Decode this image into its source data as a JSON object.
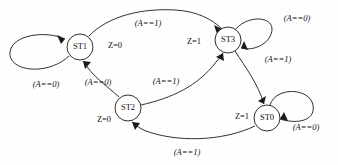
{
  "diagram": {
    "type": "state-transition-diagram",
    "stroke_color": "#1a1a1a",
    "background_color": "#fefefe",
    "states": [
      {
        "id": "ST1",
        "label": "ST1",
        "output_label": "Z=0",
        "output_var": "Z",
        "output_value": "0",
        "cx": 80,
        "cy": 47,
        "r": 13
      },
      {
        "id": "ST3",
        "label": "ST3",
        "output_label": "Z=1",
        "output_var": "Z",
        "output_value": "1",
        "cx": 228,
        "cy": 40,
        "r": 13
      },
      {
        "id": "ST2",
        "label": "ST2",
        "output_label": "Z=0",
        "output_var": "Z",
        "output_value": "0",
        "cx": 128,
        "cy": 108,
        "r": 13
      },
      {
        "id": "ST0",
        "label": "ST0",
        "output_label": "Z=1",
        "output_var": "Z",
        "output_value": "1",
        "cx": 267,
        "cy": 118,
        "r": 13
      }
    ],
    "transitions": [
      {
        "from": "ST1",
        "to": "ST1",
        "label": "(A==0)",
        "kind": "self-loop"
      },
      {
        "from": "ST1",
        "to": "ST3",
        "label": "(A==1)",
        "kind": "arc"
      },
      {
        "from": "ST3",
        "to": "ST3",
        "label": "(A==0)",
        "kind": "self-loop"
      },
      {
        "from": "ST3",
        "to": "ST0",
        "label": "(A==1)",
        "kind": "arc"
      },
      {
        "from": "ST2",
        "to": "ST1",
        "label": "(A==0)",
        "kind": "arc"
      },
      {
        "from": "ST2",
        "to": "ST3",
        "label": "(A==1)",
        "kind": "arc"
      },
      {
        "from": "ST0",
        "to": "ST0",
        "label": "(A==0)",
        "kind": "self-loop"
      },
      {
        "from": "ST0",
        "to": "ST2",
        "label": "(A==1)",
        "kind": "arc"
      }
    ],
    "labels": {
      "st1_self": "(A==0)",
      "st1_to_st3": "(A==1)",
      "st3_self": "(A==0)",
      "st3_to_st0": "(A==1)",
      "st2_to_st1": "(A==0)",
      "st2_to_st3": "(A==1)",
      "st0_self": "(A==0)",
      "st0_to_st2": "(A==1)",
      "z_st1": "Z=0",
      "z_st3": "Z=1",
      "z_st2": "Z=0",
      "z_st0": "Z=1"
    },
    "node_text": {
      "st1": "ST1",
      "st3": "ST3",
      "st2": "ST2",
      "st0": "ST0"
    }
  }
}
